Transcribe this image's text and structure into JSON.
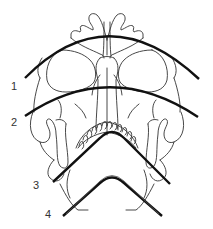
{
  "diagram": {
    "labels": [
      {
        "id": "1",
        "text": "1",
        "x": 11,
        "y": 81
      },
      {
        "id": "2",
        "text": "2",
        "x": 11,
        "y": 117
      },
      {
        "id": "3",
        "text": "3",
        "x": 33,
        "y": 180
      },
      {
        "id": "4",
        "text": "4",
        "x": 45,
        "y": 209
      }
    ],
    "arcs": [
      {
        "id": "arc-1",
        "label": "1",
        "path": "M25,78 Q108,-6 199,79"
      },
      {
        "id": "arc-2",
        "label": "2",
        "path": "M25,116 Q110,58 198,117"
      },
      {
        "id": "arc-3",
        "label": "3",
        "path": "M53,182 L100,138 Q112,126 124,138 L170,184"
      },
      {
        "id": "arc-4",
        "label": "4",
        "path": "M63,216 L100,183 Q112,172 124,183 L162,216"
      }
    ],
    "colors": {
      "line": "#111111",
      "outline": "#333333",
      "background": "#ffffff"
    }
  }
}
